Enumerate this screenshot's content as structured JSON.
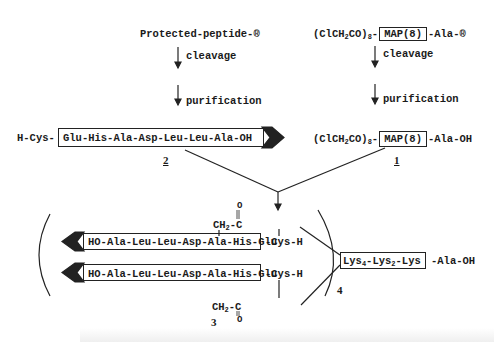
{
  "diagram": {
    "left_branch": {
      "start": "Protected-peptide-",
      "resin_symbol": "®",
      "step1": "cleavage",
      "step2": "purification",
      "product_prefix": "H-Cys-",
      "product_boxed": "Glu-His-Ala-Asp-Leu-Leu-Ala-OH",
      "label": "2"
    },
    "right_branch": {
      "start_prefix": "(ClCH",
      "start_sub1": "2",
      "start_mid": "CO)",
      "start_sub2": "8",
      "start_dash": "-",
      "start_boxed": "MAP(8)",
      "start_suffix": "-Ala-",
      "resin_symbol": "®",
      "step1": "cleavage",
      "step2": "purification",
      "product_suffix": "-Ala-OH",
      "label": "1"
    },
    "product": {
      "peptide_upper": "HO-Ala-Leu-Leu-Asp-Ala-His-Glu",
      "peptide_lower": "HO-Ala-Leu-Leu-Asp-Ala-His-Glu",
      "cys_upper": "-Cys-H",
      "cys_lower": "-Cys-H",
      "ch2": "CH",
      "ch2_sub": "2",
      "carbonyl_c": "-C",
      "carbonyl_o": "O",
      "core_lys4": "Lys",
      "core_sub4": "4",
      "core_lys2": "-Lys",
      "core_sub2": "2",
      "core_lys": "-Lys",
      "core_suffix": "-Ala-OH",
      "multiplicity": "4",
      "label": "3"
    }
  }
}
